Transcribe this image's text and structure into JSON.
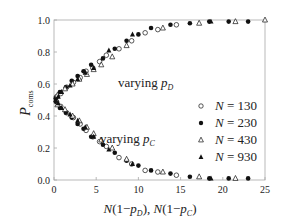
{
  "chart_data": {
    "type": "scatter",
    "title": "",
    "xlabel": "N(1−p_D), N(1−p_C)",
    "ylabel": "P_coms",
    "xlim": [
      0,
      25
    ],
    "ylim": [
      0,
      1.0
    ],
    "xticks": [
      0,
      5,
      10,
      15,
      20,
      25
    ],
    "xtick_labels": [
      "0",
      "5",
      "10",
      "15",
      "20",
      "25"
    ],
    "yticks": [
      0.0,
      0.2,
      0.4,
      0.6,
      0.8,
      1.0
    ],
    "ytick_labels": [
      "0.0",
      "0.2",
      "0.4",
      "0.6",
      "0.8",
      "1.0"
    ],
    "grid": false,
    "legend_position": "right-center",
    "annotations": [
      {
        "text": "varying p_D",
        "x": 9.5,
        "y": 0.77
      },
      {
        "text": "varying p_C",
        "x": 7.5,
        "y": 0.25
      }
    ],
    "series": [
      {
        "name": "N = 130",
        "marker": "open-circle",
        "varying_pD": {
          "x": [
            0.3,
            0.8,
            1.5,
            2.3,
            3.1,
            3.8,
            4.6,
            5.4,
            6.2,
            7.7,
            9.2,
            10.8,
            12.3,
            14.5
          ],
          "y": [
            0.52,
            0.54,
            0.58,
            0.61,
            0.64,
            0.68,
            0.7,
            0.74,
            0.78,
            0.82,
            0.87,
            0.92,
            0.94,
            0.97
          ]
        },
        "varying_pC": {
          "x": [
            0.3,
            0.8,
            1.5,
            2.3,
            3.1,
            3.8,
            4.6,
            5.4,
            6.2,
            7.7,
            9.2,
            10.8,
            12.3,
            14.5
          ],
          "y": [
            0.49,
            0.46,
            0.42,
            0.39,
            0.35,
            0.31,
            0.27,
            0.24,
            0.21,
            0.14,
            0.1,
            0.06,
            0.05,
            0.03
          ]
        }
      },
      {
        "name": "N = 230",
        "marker": "filled-circle",
        "varying_pD": {
          "x": [
            0.2,
            0.7,
            1.4,
            2.1,
            2.8,
            3.5,
            4.4,
            5.8,
            7.2,
            8.6,
            10.0,
            11.5,
            13.8,
            16.1,
            18.4,
            20.7,
            23.0
          ],
          "y": [
            0.51,
            0.55,
            0.58,
            0.62,
            0.65,
            0.68,
            0.72,
            0.76,
            0.82,
            0.87,
            0.91,
            0.95,
            0.97,
            0.98,
            0.99,
            0.99,
            0.99
          ]
        },
        "varying_pC": {
          "x": [
            0.2,
            0.7,
            1.4,
            2.1,
            2.8,
            3.5,
            4.4,
            5.8,
            7.2,
            8.6,
            10.0,
            11.5,
            13.8,
            16.1,
            18.4,
            20.7,
            23.0
          ],
          "y": [
            0.49,
            0.45,
            0.42,
            0.39,
            0.35,
            0.32,
            0.27,
            0.22,
            0.17,
            0.12,
            0.09,
            0.06,
            0.04,
            0.02,
            0.01,
            0.01,
            0.01
          ]
        }
      },
      {
        "name": "N = 430",
        "marker": "open-triangle",
        "varying_pD": {
          "x": [
            0.4,
            1.3,
            2.2,
            3.0,
            3.9,
            4.7,
            5.6,
            6.9,
            8.6,
            12.9,
            17.2,
            21.5,
            25.0
          ],
          "y": [
            0.53,
            0.57,
            0.6,
            0.63,
            0.66,
            0.69,
            0.72,
            0.77,
            0.84,
            0.95,
            0.98,
            0.99,
            1.0
          ]
        },
        "varying_pC": {
          "x": [
            0.4,
            1.3,
            2.2,
            3.0,
            3.9,
            4.7,
            5.6,
            6.9,
            8.6,
            12.9,
            17.2,
            21.5
          ],
          "y": [
            0.47,
            0.44,
            0.4,
            0.37,
            0.33,
            0.29,
            0.25,
            0.2,
            0.13,
            0.05,
            0.02,
            0.01
          ]
        }
      },
      {
        "name": "N = 930",
        "marker": "filled-triangle",
        "varying_pD": {
          "x": [
            0.5,
            0.9,
            1.9,
            2.8,
            3.7,
            4.7,
            6.5,
            9.3,
            18.6
          ],
          "y": [
            0.52,
            0.55,
            0.59,
            0.63,
            0.67,
            0.7,
            0.81,
            0.91,
            0.99
          ]
        },
        "varying_pC": {
          "x": [
            0.5,
            0.9,
            1.9,
            2.8,
            3.7,
            4.7,
            6.5,
            9.3,
            18.6
          ],
          "y": [
            0.48,
            0.45,
            0.41,
            0.37,
            0.33,
            0.27,
            0.19,
            0.1,
            0.01
          ]
        }
      }
    ]
  },
  "legend": {
    "items": [
      {
        "label": "N = 130",
        "marker": "open-circle"
      },
      {
        "label": "N = 230",
        "marker": "filled-circle"
      },
      {
        "label": "N = 430",
        "marker": "open-triangle"
      },
      {
        "label": "N = 930",
        "marker": "filled-triangle"
      }
    ]
  },
  "colors": {
    "axis": "#9a9a9a",
    "marker": "#111111",
    "text": "#222222"
  }
}
